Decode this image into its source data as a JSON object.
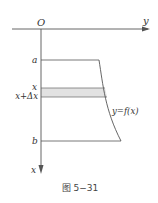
{
  "figure": {
    "origin_label": "O",
    "horizontal_axis_label": "y",
    "vertical_axis_label": "x",
    "lower_bound_label": "a",
    "upper_bound_label": "b",
    "strip_top_label": "x",
    "strip_bottom_label": "x+Δx",
    "curve_label": "y=f(x)",
    "caption": "图 5−31"
  },
  "colors": {
    "line": "#555555",
    "strip_fill": "#e2e2e2",
    "text": "#333333"
  }
}
